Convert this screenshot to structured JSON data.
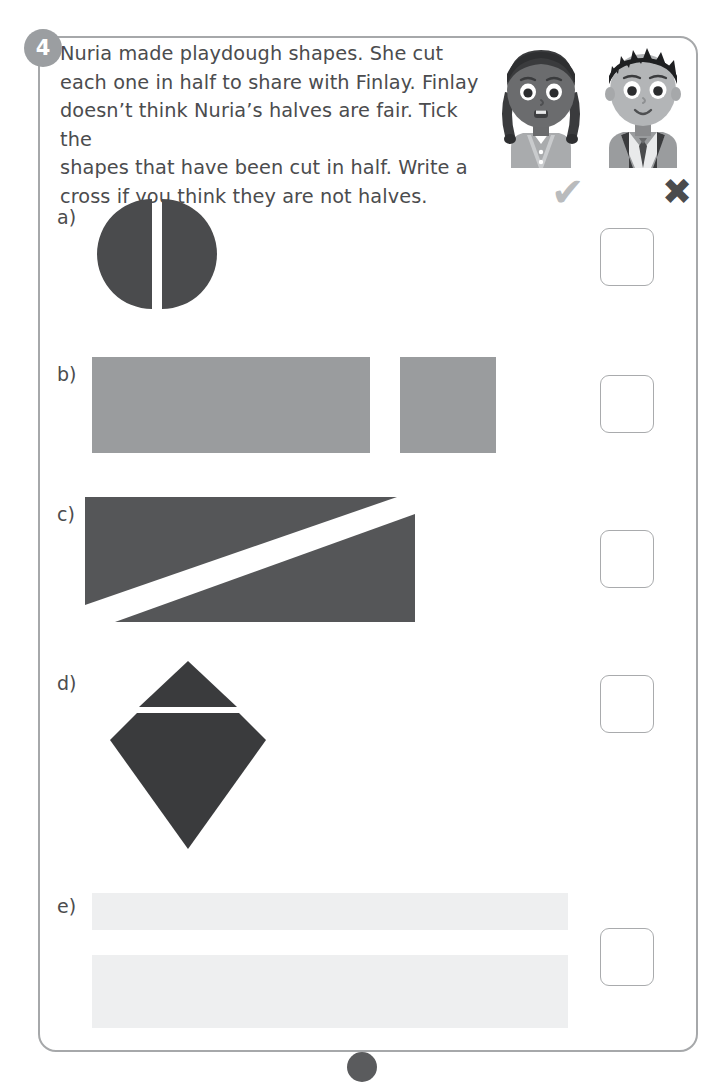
{
  "worksheet": {
    "question_number": "4",
    "question_text": "Nuria made playdough shapes. She cut each one in half to share with Finlay. Finlay doesn’t think Nuria’s halves are fair. Tick the shapes that have been cut in half. Write a cross if you think they are not halves.",
    "question_lines": [
      "Nuria made playdough shapes. She cut",
      "each one in half to share with Finlay. Finlay",
      "doesn’t think Nuria’s halves are fair. Tick the",
      "shapes that have been cut in half. Write a",
      "cross if you think they are not halves."
    ],
    "characters": [
      {
        "name": "Nuria",
        "icon": "girl-avatar-icon"
      },
      {
        "name": "Finlay",
        "icon": "boy-avatar-icon"
      }
    ],
    "legend": {
      "tick_symbol": "✔",
      "tick_meaning": "cut in half",
      "cross_symbol": "✖",
      "cross_meaning": "not halves"
    },
    "parts": [
      {
        "label": "a)",
        "shape": "circle-split-vertically",
        "description": "Circle cut into two equal halves by a vertical line",
        "fill": "#4a4b4d",
        "answer": ""
      },
      {
        "label": "b)",
        "shape": "two-unequal-rectangles",
        "description": "One large rectangle and one small rectangle",
        "fill": "#9a9c9e",
        "answer": ""
      },
      {
        "label": "c)",
        "shape": "rectangle-split-diagonally",
        "description": "Rectangle cut along a diagonal into two triangles",
        "fill": "#555658",
        "answer": ""
      },
      {
        "label": "d)",
        "shape": "diamond-split-horizontally",
        "description": "Diamond cut by a horizontal line into a small triangle and a larger pentagon",
        "fill": "#3a3b3d",
        "answer": ""
      },
      {
        "label": "e)",
        "shape": "two-unequal-bars",
        "description": "Two pale bars of equal width but different heights",
        "fill": "#eeeff0",
        "answer": ""
      }
    ],
    "colors": {
      "frame_border": "#a6a8aa",
      "badge": "#9b9ea1",
      "text": "#4b4c4e",
      "tick": "#b9bbbd",
      "cross": "#4a4b4d",
      "answer_box_border": "#a9abad",
      "page_marker": "#5a5b5d"
    }
  }
}
